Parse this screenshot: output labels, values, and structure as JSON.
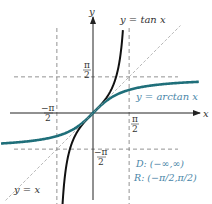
{
  "chart_data": {
    "type": "line",
    "title": "",
    "xlabel": "x",
    "ylabel": "y",
    "xlim": [
      -4.0,
      4.8
    ],
    "ylim": [
      -4.0,
      4.6
    ],
    "grid": false,
    "series": [
      {
        "name": "y = tan x",
        "function": "tan",
        "domain": [
          -1.38,
          1.3
        ],
        "color": "#111111"
      },
      {
        "name": "y = arctan x",
        "function": "arctan",
        "domain": [
          -4.0,
          4.6
        ],
        "color": "#1f6f7a"
      },
      {
        "name": "y = x",
        "function": "identity",
        "domain": [
          -3.8,
          3.8
        ],
        "color": "#999999",
        "style": "dashed"
      }
    ],
    "asymptotes": {
      "vertical": [
        -1.5708,
        1.5708
      ],
      "horizontal": [
        -1.5708,
        1.5708
      ],
      "style": "dashed"
    },
    "tick_labels": {
      "x_pos": {
        "num": "π",
        "den": "2"
      },
      "x_neg": {
        "num": "−π",
        "den": "2"
      },
      "y_pos": {
        "num": "π",
        "den": "2"
      },
      "y_neg": {
        "num": "−π",
        "den": "2"
      }
    },
    "annotations": {
      "tan_label": "y  =  tan x",
      "arctan_label": "y  =  arctan x",
      "identity_label": "y  =  x",
      "domain": "D: (−∞,∞)",
      "range": "R: (−π/2,π/2)"
    }
  }
}
